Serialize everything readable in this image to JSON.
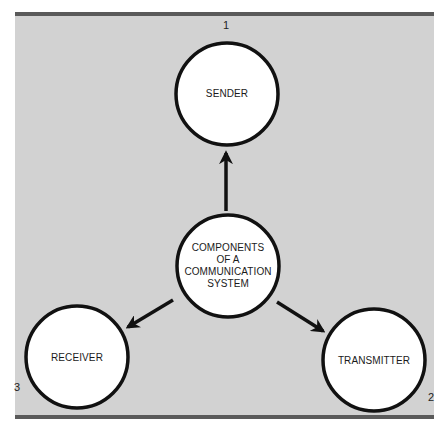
{
  "diagram": {
    "title": "Components of a Communication System",
    "background_color": "#d2d2d2",
    "rule_color": "#5a5a5a",
    "center_node": {
      "lines": [
        "COMPONENTS",
        "OF A",
        "COMMUNICATION",
        "SYSTEM"
      ]
    },
    "nodes": [
      {
        "id": "sender",
        "label": "SENDER",
        "number": "1"
      },
      {
        "id": "transmitter",
        "label": "TRANSMITTER",
        "number": "2"
      },
      {
        "id": "receiver",
        "label": "RECEIVER",
        "number": "3"
      }
    ],
    "edges": [
      {
        "from": "center",
        "to": "sender"
      },
      {
        "from": "center",
        "to": "transmitter"
      },
      {
        "from": "center",
        "to": "receiver"
      }
    ]
  }
}
